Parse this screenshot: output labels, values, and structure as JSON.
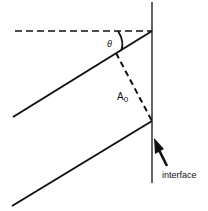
{
  "diagram": {
    "labels": {
      "theta": "θ",
      "amplitude": "A",
      "amplitude_subscript": "0",
      "interface": "interface"
    },
    "colors": {
      "line": "#111111",
      "background": "#ffffff"
    }
  }
}
